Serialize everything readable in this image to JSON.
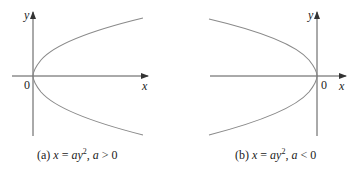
{
  "panels": [
    {
      "id": "a",
      "caption_prefix": "(a)",
      "equation_lhs": "x",
      "equation_eq": " = ",
      "equation_a": "a",
      "equation_y": "y",
      "equation_exp": "2",
      "condition_sep": ", ",
      "condition_var": "a",
      "condition_op": " > ",
      "condition_val": "0",
      "axis_x_label": "x",
      "axis_y_label": "y",
      "origin_label": "0",
      "opens": "right"
    },
    {
      "id": "b",
      "caption_prefix": "(b)",
      "equation_lhs": "x",
      "equation_eq": " = ",
      "equation_a": "a",
      "equation_y": "y",
      "equation_exp": "2",
      "condition_sep": ", ",
      "condition_var": "a",
      "condition_op": " < ",
      "condition_val": "0",
      "axis_x_label": "x",
      "axis_y_label": "y",
      "origin_label": "0",
      "opens": "left"
    }
  ],
  "colors": {
    "axis": "#555555",
    "curve": "#8a8a8a",
    "text": "#222222"
  }
}
